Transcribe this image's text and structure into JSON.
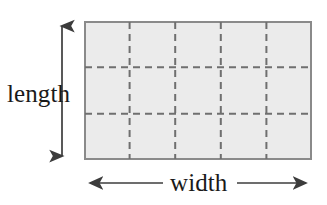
{
  "figure": {
    "name": "rectangle-area-diagram",
    "labels": {
      "length": "length",
      "width": "width"
    },
    "colors": {
      "fill": "#ebebeb",
      "border": "#8a8a8a",
      "grid": "#6f6f6f",
      "arrow": "#3c3c3c",
      "text": "#1a1a1a",
      "background": "#ffffff"
    },
    "rectangle": {
      "x": 84,
      "y": 21,
      "width": 228,
      "height": 139,
      "border_width": 2,
      "columns": 5,
      "rows": 3,
      "grid_style": "dashed",
      "grid_dash": "7 5",
      "grid_width": 2,
      "vertical_grid_x": [
        129.6,
        175.2,
        220.8,
        266.4
      ],
      "horizontal_grid_y": [
        67.3,
        113.7
      ]
    },
    "length_arrow": {
      "orientation": "vertical",
      "x": 62,
      "y_top": 20,
      "y_bottom": 162,
      "double_headed": true
    },
    "width_arrow": {
      "orientation": "horizontal",
      "y": 183,
      "x_left": 84,
      "x_right": 312,
      "double_headed": true,
      "label_gap_left": 163,
      "label_gap_right": 237
    }
  }
}
